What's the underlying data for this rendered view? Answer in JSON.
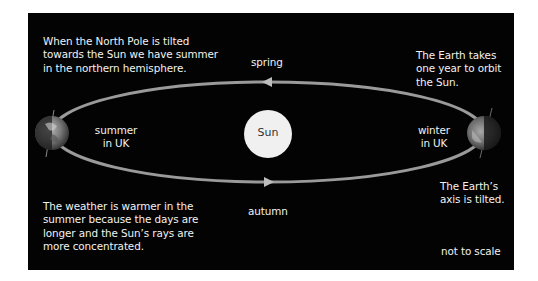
{
  "diagram": {
    "colors": {
      "background": "#030303",
      "page": "#ffffff",
      "text": "#f2f2f2",
      "orbit": "#9a9a9a",
      "sun": "#f0f0f0",
      "sun_text": "#333333"
    },
    "sun": {
      "label": "Sun"
    },
    "seasons": {
      "spring": "spring",
      "autumn": "autumn"
    },
    "earth_left": {
      "label_line1": "summer",
      "label_line2": "in UK"
    },
    "earth_right": {
      "label_line1": "winter",
      "label_line2": "in UK"
    },
    "notes": {
      "north_pole": [
        "When the North Pole is tilted",
        "towards the Sun we have summer",
        "in the northern hemisphere."
      ],
      "orbit_year": [
        "The Earth takes",
        "one year to orbit",
        "the Sun."
      ],
      "weather": [
        "The weather is warmer in the",
        "summer because the days are",
        "longer and the Sun’s rays are",
        "more concentrated."
      ],
      "axis": [
        "The Earth’s",
        "axis is tilted."
      ],
      "scale": "not to scale"
    }
  }
}
